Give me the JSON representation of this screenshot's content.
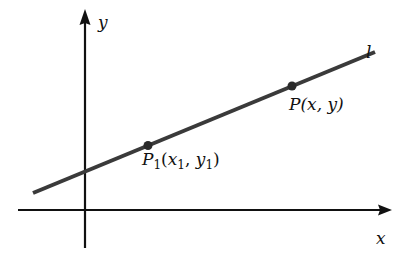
{
  "figure": {
    "colors": {
      "background": "#ffffff",
      "axes": "#111111",
      "line": "#3a3a3a",
      "points": "#2a2a2a"
    }
  },
  "axes": {
    "x_label": "x",
    "y_label": "y",
    "origin_px": [
      85,
      210
    ],
    "x_axis_px": {
      "from": [
        18,
        210
      ],
      "to": [
        391,
        210
      ]
    },
    "y_axis_px": {
      "from": [
        85,
        248
      ],
      "to": [
        85,
        10
      ]
    }
  },
  "line": {
    "label": "l",
    "from_px": [
      33,
      193
    ],
    "to_px": [
      375,
      52
    ]
  },
  "points": [
    {
      "id": "P1",
      "label_main": "P",
      "label_sub": "1",
      "label_open": "(",
      "label_x": "x",
      "label_x_sub": "1",
      "label_comma": ", ",
      "label_y": "y",
      "label_y_sub": "1",
      "label_close": ")",
      "full_label": "P1(x1, y1)",
      "px": [
        148,
        145
      ]
    },
    {
      "id": "P",
      "label": "P(x, y)",
      "px": [
        292,
        86
      ]
    }
  ]
}
